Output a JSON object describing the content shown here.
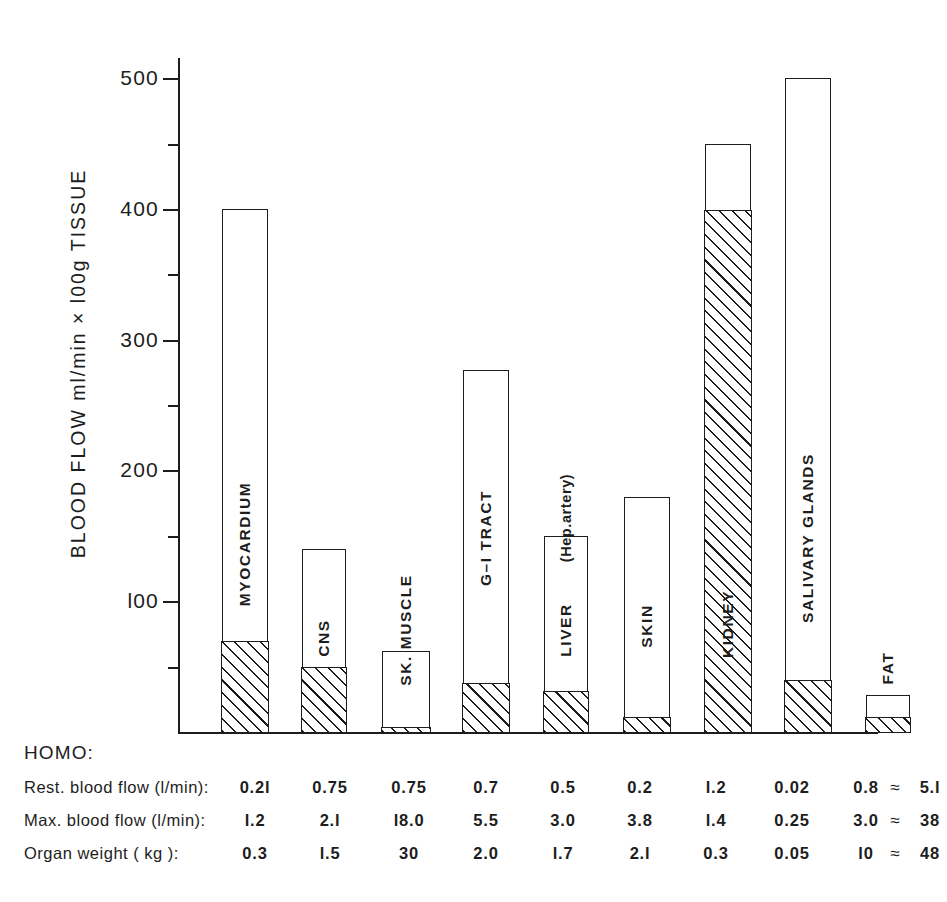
{
  "chart_data": {
    "type": "bar",
    "title": "",
    "ylabel": "BLOOD  FLOW  ml/min × l00g  TISSUE",
    "xlabel": "",
    "ylim": [
      0,
      520
    ],
    "grid": false,
    "legend": "none",
    "y_major_ticks": [
      100,
      200,
      300,
      400,
      500
    ],
    "y_minor_ticks": [
      50,
      150,
      250,
      350,
      450
    ],
    "y_tick_labels": [
      "l00",
      "200",
      "300",
      "400",
      "500"
    ],
    "categories": [
      "MYOCARDIUM",
      "CNS",
      "SK. MUSCLE",
      "G–I TRACT",
      "LIVER",
      "SKIN",
      "KIDNEY",
      "SALIVARY GLANDS",
      "FAT"
    ],
    "annotations": [
      {
        "text": "(Hep.artery)",
        "category": "LIVER"
      }
    ],
    "series": [
      {
        "name": "Maximal blood flow (bar total, open)",
        "values": [
          400,
          140,
          62,
          277,
          150,
          180,
          450,
          500,
          28
        ]
      },
      {
        "name": "Resting blood flow (hatched base)",
        "values": [
          70,
          50,
          4,
          38,
          32,
          12,
          400,
          40,
          12
        ]
      }
    ]
  },
  "table": {
    "heading": "HOMO:",
    "rows": [
      {
        "label": "Rest. blood flow (l/min):",
        "values": [
          "0.2l",
          "0.75",
          "0.75",
          "0.7",
          "0.5",
          "0.2",
          "l.2",
          "0.02",
          "0.8"
        ],
        "approx_symbol": "≈",
        "total": "5.l"
      },
      {
        "label": "Max. blood flow (l/min):",
        "values": [
          "l.2",
          "2.l",
          "l8.0",
          "5.5",
          "3.0",
          "3.8",
          "l.4",
          "0.25",
          "3.0"
        ],
        "approx_symbol": "≈",
        "total": "38"
      },
      {
        "label": "Organ  weight (  kg ):",
        "values": [
          "0.3",
          "l.5",
          "30",
          "2.0",
          "l.7",
          "2.l",
          "0.3",
          "0.05",
          "l0"
        ],
        "approx_symbol": "≈",
        "total": "48"
      }
    ]
  },
  "colors": {
    "ink": "#1d1d1d",
    "paper": "#ffffff"
  }
}
